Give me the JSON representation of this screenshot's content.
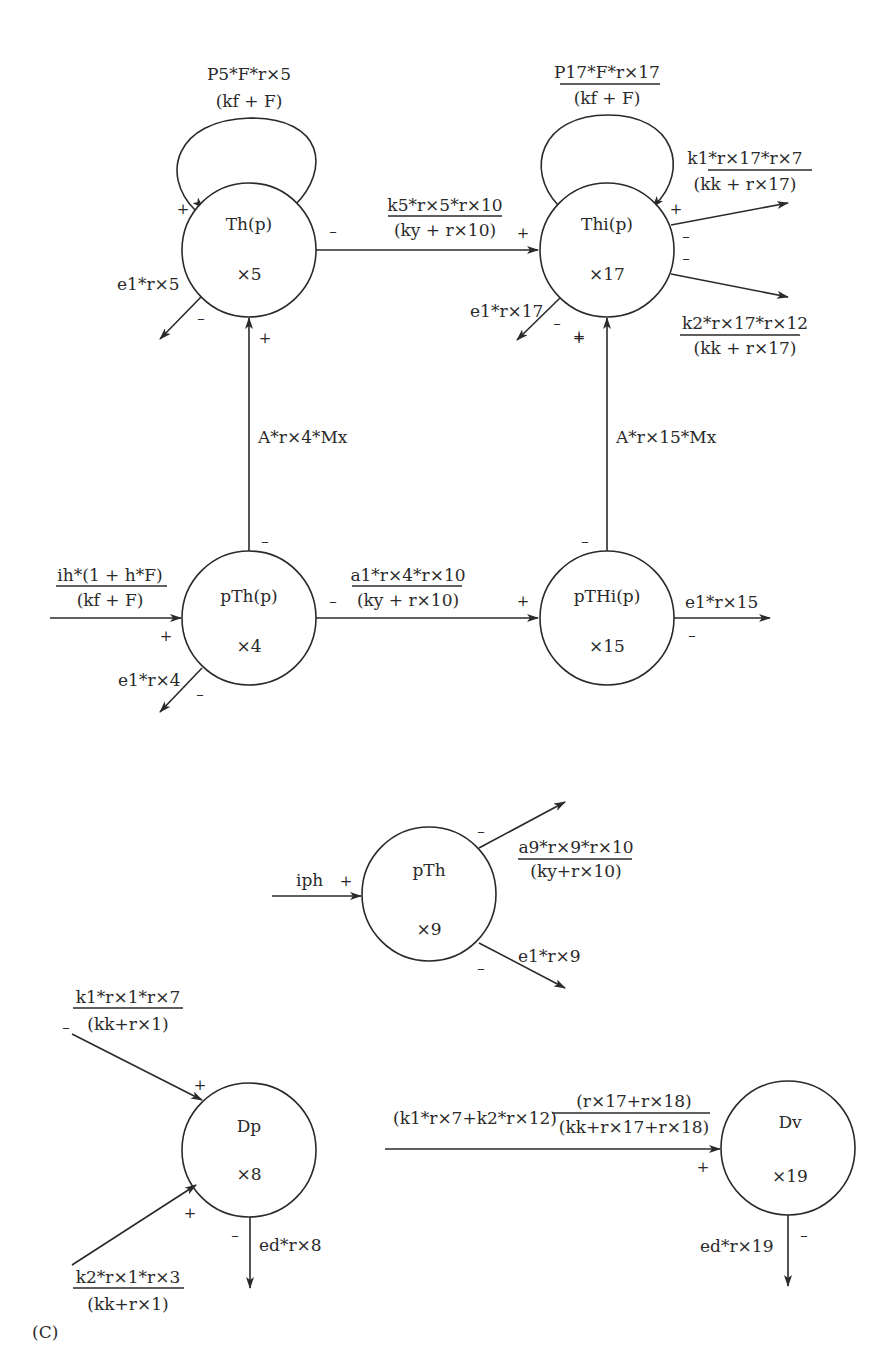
{
  "figure_label": "(C)",
  "nodes": {
    "th": {
      "name": "Th(p)",
      "var": "×5"
    },
    "thi": {
      "name": "Thi(p)",
      "var": "×17"
    },
    "pth": {
      "name": "pTh(p)",
      "var": "×4"
    },
    "pthi": {
      "name": "pTHi(p)",
      "var": "×15"
    },
    "pth2": {
      "name": "pTh",
      "var": "×9"
    },
    "dp": {
      "name": "Dp",
      "var": "×8"
    },
    "dv": {
      "name": "Dv",
      "var": "×19"
    }
  },
  "edges": {
    "th_self": {
      "num": "P5*F*r×5",
      "den": "(kf + F)"
    },
    "thi_self": {
      "num": "P17*F*r×17",
      "den": "(kf + F)"
    },
    "th_to_thi": {
      "num": "k5*r×5*r×10",
      "den": "(ky + r×10)"
    },
    "thi_out1": {
      "num": "k1*r×17*r×7",
      "den": "(kk + r×17)"
    },
    "thi_out2": {
      "num": "k2*r×17*r×12",
      "den": "(kk + r×17)"
    },
    "th_decay": "e1*r×5",
    "thi_decay": "e1*r×17",
    "pth_to_th": "A*r×4*Mx",
    "pthi_to_thi": "A*r×15*Mx",
    "pth_in": {
      "num": "ih*(1 + h*F)",
      "den": "(kf + F)"
    },
    "pth_to_pthi": {
      "num": "a1*r×4*r×10",
      "den": "(ky + r×10)"
    },
    "pth_decay": "e1*r×4",
    "pthi_decay": "e1*r×15",
    "pth2_in": "iph",
    "pth2_out": {
      "num": "a9*r×9*r×10",
      "den": "(ky+r×10)"
    },
    "pth2_decay": "e1*r×9",
    "dp_in1": {
      "num": "k1*r×1*r×7",
      "den": "(kk+r×1)"
    },
    "dp_in2": {
      "num": "k2*r×1*r×3",
      "den": "(kk+r×1)"
    },
    "dp_decay": "ed*r×8",
    "dv_in_prefix": "(k1*r×7+k2*r×12)",
    "dv_in": {
      "num": "(r×17+r×18)",
      "den": "(kk+r×17+r×18)"
    },
    "dv_decay": "ed*r×19"
  },
  "signs": {
    "plus": "+",
    "minus": "–"
  }
}
